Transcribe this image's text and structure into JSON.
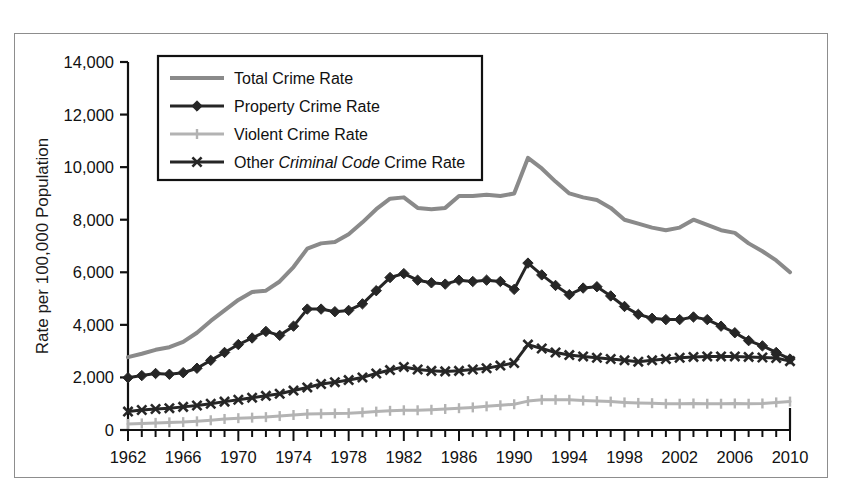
{
  "figure": {
    "border_color": "#8d8d8d",
    "background": "#ffffff"
  },
  "chart_data": {
    "type": "line",
    "title": "",
    "xlabel": "",
    "ylabel": "Rate per 100,000 Population",
    "xlim": [
      1962,
      2010
    ],
    "ylim": [
      0,
      14000
    ],
    "ytick_labels": [
      "0",
      "2,000",
      "4,000",
      "6,000",
      "8,000",
      "10,000",
      "12,000",
      "14,000"
    ],
    "ytick_values": [
      0,
      2000,
      4000,
      6000,
      8000,
      10000,
      12000,
      14000
    ],
    "xtick_labels": [
      "1962",
      "1966",
      "1970",
      "1974",
      "1978",
      "1982",
      "1986",
      "1990",
      "1994",
      "1998",
      "2002",
      "2006",
      "2010"
    ],
    "xtick_values": [
      1962,
      1966,
      1970,
      1974,
      1978,
      1982,
      1986,
      1990,
      1994,
      1998,
      2002,
      2006,
      2010
    ],
    "minor_xtick_interval": 1,
    "grid": false,
    "legend_position": "upper-left-inside",
    "x": [
      1962,
      1963,
      1964,
      1965,
      1966,
      1967,
      1968,
      1969,
      1970,
      1971,
      1972,
      1973,
      1974,
      1975,
      1976,
      1977,
      1978,
      1979,
      1980,
      1981,
      1982,
      1983,
      1984,
      1985,
      1986,
      1987,
      1988,
      1989,
      1990,
      1991,
      1992,
      1993,
      1994,
      1995,
      1996,
      1997,
      1998,
      1999,
      2000,
      2001,
      2002,
      2003,
      2004,
      2005,
      2006,
      2007,
      2008,
      2009,
      2010
    ],
    "series": [
      {
        "name": "Total Crime Rate",
        "color": "#8a8a8a",
        "marker": "none",
        "line_width": 4,
        "values": [
          2771,
          2900,
          3050,
          3150,
          3350,
          3700,
          4150,
          4550,
          4950,
          5250,
          5300,
          5650,
          6200,
          6900,
          7100,
          7150,
          7450,
          7900,
          8400,
          8800,
          8850,
          8450,
          8400,
          8450,
          8900,
          8900,
          8950,
          8900,
          9000,
          10350,
          9950,
          9450,
          9000,
          8850,
          8750,
          8450,
          8000,
          7850,
          7700,
          7600,
          7700,
          8000,
          7800,
          7600,
          7500,
          7100,
          6800,
          6450,
          6000
        ]
      },
      {
        "name": "Property Crime Rate",
        "color": "#262626",
        "marker": "diamond",
        "line_width": 3,
        "values": [
          1990,
          2070,
          2150,
          2120,
          2180,
          2350,
          2650,
          2950,
          3250,
          3500,
          3750,
          3600,
          3950,
          4600,
          4600,
          4500,
          4550,
          4800,
          5300,
          5800,
          5950,
          5700,
          5600,
          5550,
          5700,
          5650,
          5700,
          5650,
          5350,
          6350,
          5900,
          5500,
          5150,
          5400,
          5450,
          5100,
          4700,
          4400,
          4250,
          4200,
          4200,
          4300,
          4200,
          3950,
          3700,
          3400,
          3200,
          2950,
          2700
        ]
      },
      {
        "name": "Violent Crime Rate",
        "color": "#b3b3b3",
        "marker": "plus",
        "line_width": 3,
        "values": [
          230,
          250,
          270,
          290,
          300,
          330,
          370,
          420,
          450,
          470,
          490,
          530,
          570,
          610,
          620,
          630,
          640,
          670,
          700,
          730,
          750,
          750,
          770,
          800,
          830,
          860,
          900,
          940,
          980,
          1100,
          1150,
          1150,
          1150,
          1120,
          1100,
          1080,
          1050,
          1030,
          1020,
          1000,
          1000,
          1010,
          1000,
          1000,
          1010,
          1000,
          1010,
          1050,
          1080
        ]
      },
      {
        "name": "Other Criminal Code Crime Rate",
        "color": "#262626",
        "marker": "x",
        "line_width": 3,
        "values": [
          700,
          760,
          800,
          830,
          880,
          930,
          1000,
          1080,
          1150,
          1230,
          1300,
          1380,
          1500,
          1620,
          1750,
          1820,
          1900,
          2000,
          2150,
          2280,
          2400,
          2300,
          2250,
          2230,
          2250,
          2300,
          2350,
          2450,
          2550,
          3250,
          3100,
          2950,
          2850,
          2800,
          2750,
          2700,
          2650,
          2600,
          2650,
          2700,
          2750,
          2780,
          2800,
          2800,
          2800,
          2780,
          2760,
          2740,
          2620
        ]
      }
    ],
    "legend": [
      {
        "label": "Total Crime Rate",
        "color": "#8a8a8a",
        "marker": "none",
        "italic_part": ""
      },
      {
        "label": "Property Crime Rate",
        "color": "#262626",
        "marker": "diamond",
        "italic_part": ""
      },
      {
        "label": "Violent Crime Rate",
        "color": "#b3b3b3",
        "marker": "plus",
        "italic_part": ""
      },
      {
        "label": "Other Criminal Code Crime Rate",
        "color": "#262626",
        "marker": "x",
        "italic_part": "Criminal Code",
        "pre": "Other ",
        "post": " Crime Rate"
      }
    ]
  }
}
